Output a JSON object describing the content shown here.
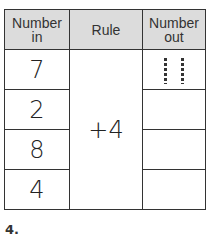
{
  "table": {
    "headers": {
      "number_in": [
        "Number",
        "in"
      ],
      "rule": "Rule",
      "number_out": [
        "Number",
        "out"
      ]
    },
    "rule_value": "+4",
    "rows": [
      {
        "in": "7",
        "out": "11",
        "out_style": "traced-dashed"
      },
      {
        "in": "2",
        "out": ""
      },
      {
        "in": "8",
        "out": ""
      },
      {
        "in": "4",
        "out": ""
      }
    ]
  },
  "problem_number": "4.",
  "colors": {
    "header_bg": "#dcdcdc",
    "border": "#333333",
    "text": "#222222"
  }
}
